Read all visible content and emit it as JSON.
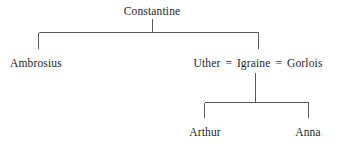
{
  "diagram": {
    "type": "family-tree",
    "line_color": "#5a5a5a",
    "text_color": "#201f1f",
    "background_color": "#ffffff",
    "generations": [
      {
        "level": 1,
        "nodes": [
          {
            "id": "constantine",
            "label": "Constantine"
          }
        ]
      },
      {
        "level": 2,
        "nodes": [
          {
            "id": "ambrosius",
            "label": "Ambrosius"
          },
          {
            "id": "uther",
            "label": "Uther"
          },
          {
            "id": "igraine",
            "label": "Igraine"
          },
          {
            "id": "gorlois",
            "label": "Gorlois"
          }
        ],
        "marriage_symbol": "="
      },
      {
        "level": 3,
        "nodes": [
          {
            "id": "arthur",
            "label": "Arthur"
          },
          {
            "id": "anna",
            "label": "Anna"
          }
        ]
      }
    ],
    "labels": {
      "constantine": "Constantine",
      "ambrosius": "Ambrosius",
      "uther": "Uther",
      "igraine": "Igraine",
      "gorlois": "Gorlois",
      "arthur": "Arthur",
      "anna": "Anna",
      "marriage_left": "=",
      "marriage_right": "="
    }
  }
}
